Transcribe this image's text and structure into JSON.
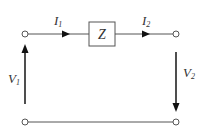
{
  "diagram": {
    "type": "two-port series impedance circuit",
    "element": {
      "label": "Z"
    },
    "currents": [
      {
        "symbol": "I",
        "subscript": "1",
        "direction": "right"
      },
      {
        "symbol": "I",
        "subscript": "2",
        "direction": "right"
      }
    ],
    "voltages": [
      {
        "symbol": "V",
        "subscript": "1",
        "arrow_direction": "up"
      },
      {
        "symbol": "V",
        "subscript": "2",
        "arrow_direction": "down"
      }
    ],
    "terminals": [
      "top-left",
      "top-right",
      "bottom-left",
      "bottom-right"
    ],
    "colors": {
      "wire": "#555555",
      "arrow": "#111111",
      "text": "#333333",
      "background": "#ffffff"
    }
  }
}
